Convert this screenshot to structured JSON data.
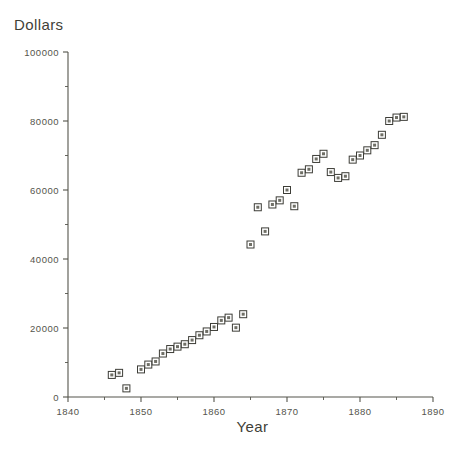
{
  "chart_data": {
    "type": "scatter",
    "title": "",
    "xlabel": "Year",
    "ylabel": "Dollars",
    "xlim": [
      1840,
      1890
    ],
    "ylim": [
      0,
      100000
    ],
    "grid": false,
    "legend": null,
    "x_ticks": [
      1840,
      1850,
      1860,
      1870,
      1880,
      1890
    ],
    "x_tick_labels": [
      "1840",
      "1850",
      "1860",
      "1870",
      "1880",
      "1890"
    ],
    "x_minor_ticks": [
      1845,
      1855,
      1865,
      1875,
      1885
    ],
    "y_ticks": [
      0,
      20000,
      40000,
      60000,
      80000,
      100000
    ],
    "y_tick_labels": [
      "0",
      "20000",
      "40000",
      "60000",
      "80000",
      "100000"
    ],
    "y_minor_ticks": [
      10000,
      30000,
      50000,
      70000,
      90000
    ],
    "marker": "square-open-with-center-dot",
    "marker_color": "#3d3d37",
    "series": [
      {
        "name": "Dollars",
        "x": [
          1846,
          1847,
          1848,
          1850,
          1851,
          1852,
          1853,
          1854,
          1855,
          1856,
          1857,
          1858,
          1859,
          1860,
          1861,
          1862,
          1863,
          1864,
          1865,
          1866,
          1867,
          1868,
          1869,
          1870,
          1871,
          1872,
          1873,
          1874,
          1875,
          1876,
          1877,
          1878,
          1879,
          1880,
          1881,
          1882,
          1883,
          1884,
          1885,
          1886
        ],
        "y": [
          6400,
          7000,
          2500,
          8000,
          9400,
          10300,
          12600,
          13900,
          14600,
          15300,
          16500,
          17900,
          19000,
          20300,
          22200,
          23000,
          20100,
          24000,
          44200,
          55000,
          48000,
          55800,
          57000,
          60000,
          55300,
          65000,
          66000,
          69000,
          70500,
          65200,
          63500,
          64000,
          68800,
          70000,
          71500,
          73000,
          76000,
          80000,
          81000,
          81200
        ]
      }
    ]
  },
  "axes": {
    "x_axis_name": "year-axis",
    "y_axis_name": "dollars-axis"
  }
}
